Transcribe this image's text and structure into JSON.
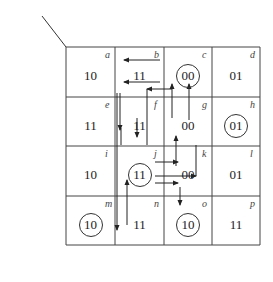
{
  "axes": {
    "col_var": "x",
    "col_var_parts": [
      "x",
      "1",
      "x",
      "2"
    ],
    "row_var_parts": [
      "y",
      "1f",
      "y",
      "2f"
    ],
    "output_parts": [
      "Y",
      "1e",
      "Y",
      "2e"
    ]
  },
  "col_headers": [
    "0 0",
    "0 1",
    "1 1",
    "1 0"
  ],
  "row_headers": [
    "0 0",
    "0 1",
    "1 1",
    "1 0"
  ],
  "cells": [
    [
      {
        "label": "a",
        "value": "10",
        "stable": false
      },
      {
        "label": "b",
        "value": "11",
        "stable": false
      },
      {
        "label": "c",
        "value": "00",
        "stable": true
      },
      {
        "label": "d",
        "value": "01",
        "stable": false
      }
    ],
    [
      {
        "label": "e",
        "value": "11",
        "stable": false
      },
      {
        "label": "f",
        "value": "11",
        "stable": false
      },
      {
        "label": "g",
        "value": "00",
        "stable": false
      },
      {
        "label": "h",
        "value": "01",
        "stable": true
      }
    ],
    [
      {
        "label": "i",
        "value": "10",
        "stable": false
      },
      {
        "label": "j",
        "value": "11",
        "stable": true
      },
      {
        "label": "k",
        "value": "00",
        "stable": false
      },
      {
        "label": "l",
        "value": "01",
        "stable": false
      }
    ],
    [
      {
        "label": "m",
        "value": "10",
        "stable": true
      },
      {
        "label": "n",
        "value": "11",
        "stable": false
      },
      {
        "label": "o",
        "value": "10",
        "stable": true
      },
      {
        "label": "p",
        "value": "11",
        "stable": false
      }
    ]
  ]
}
